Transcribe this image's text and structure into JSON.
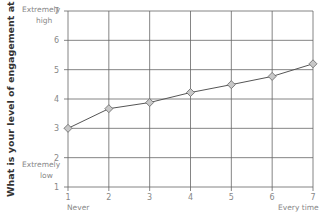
{
  "chart_data": {
    "type": "line",
    "title": "",
    "xlabel": "",
    "ylabel": "What is your level of engagement at work?",
    "x": [
      1,
      2,
      3,
      4,
      5,
      6,
      7
    ],
    "series": [
      {
        "name": "Engagement",
        "values": [
          3.0,
          3.67,
          3.88,
          4.22,
          4.49,
          4.77,
          5.2
        ]
      }
    ],
    "xlim": [
      1,
      7
    ],
    "ylim": [
      1,
      7
    ],
    "xticks": [
      1,
      2,
      3,
      4,
      5,
      6,
      7
    ],
    "yticks": [
      1,
      2,
      3,
      4,
      5,
      6,
      7
    ],
    "grid": true,
    "marker": "diamond",
    "annotations": {
      "y_high": "Extremely high",
      "y_low": "Extremely low",
      "x_low": "Never",
      "x_high": "Every time"
    },
    "colors": {
      "line": "#555555",
      "marker_fill": "#c8c8c8",
      "grid": "#666666"
    }
  },
  "labels": {
    "ytitle": "What is your level of engagement at work?",
    "y_high_1": "Extremely",
    "y_high_2": "high",
    "y_low_1": "Extremely",
    "y_low_2": "low",
    "x_low": "Never",
    "x_high": "Every time"
  }
}
